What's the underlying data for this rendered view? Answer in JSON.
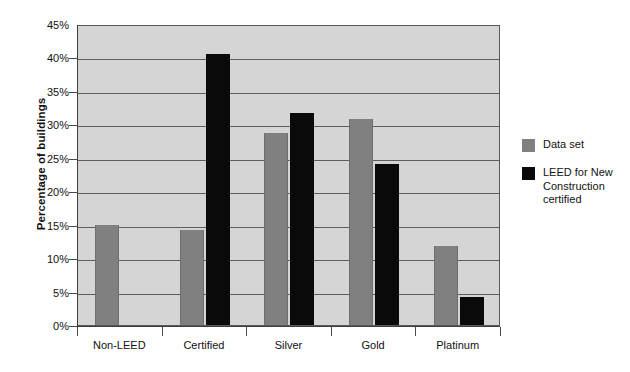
{
  "chart_data": {
    "type": "bar",
    "title": "",
    "xlabel": "",
    "ylabel": "Percentage of buildings",
    "categories": [
      "Non-LEED",
      "Certified",
      "Silver",
      "Gold",
      "Platinum"
    ],
    "series": [
      {
        "name": "Data set",
        "color": "#808080",
        "values": [
          15.0,
          14.2,
          28.7,
          30.8,
          11.8
        ]
      },
      {
        "name": "LEED for New Construction certified",
        "color": "#0a0a0a",
        "values": [
          null,
          40.5,
          31.7,
          24.1,
          4.2
        ]
      }
    ],
    "ylim": [
      0,
      45
    ],
    "ytick_values": [
      0,
      5,
      10,
      15,
      20,
      25,
      30,
      35,
      40,
      45
    ],
    "ytick_labels": [
      "0%",
      "5%",
      "10%",
      "15%",
      "20%",
      "25%",
      "30%",
      "35%",
      "40%",
      "45%"
    ],
    "grid": true,
    "legend_position": "right",
    "plot_background": "#d5d5d5"
  },
  "legend": {
    "entries": [
      {
        "label": "Data set"
      },
      {
        "label": "LEED for New Construction certified"
      }
    ]
  }
}
